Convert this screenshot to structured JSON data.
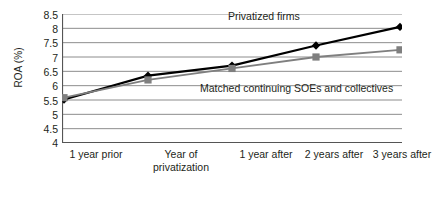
{
  "chart_data": {
    "type": "line",
    "title": "",
    "xlabel": "",
    "ylabel": "ROA (%)",
    "categories": [
      "1 year prior",
      "Year of privatization",
      "1 year after",
      "2 years after",
      "3 years after"
    ],
    "series": [
      {
        "name": "Privatized firms",
        "color": "#000000",
        "marker": "diamond",
        "values": [
          5.52,
          6.35,
          6.7,
          7.4,
          8.05
        ]
      },
      {
        "name": "Matched continuing SOEs and collectives",
        "color": "#7f7f7f",
        "marker": "square",
        "values": [
          5.58,
          6.2,
          6.6,
          7.0,
          7.25
        ]
      }
    ],
    "ylim": [
      4,
      8.5
    ],
    "yticks": [
      "4",
      "4.5",
      "5",
      "5.5",
      "6",
      "6.5",
      "7",
      "7.5",
      "8",
      "8.5"
    ],
    "ytick_values": [
      4,
      4.5,
      5,
      5.5,
      6,
      6.5,
      7,
      7.5,
      8,
      8.5
    ],
    "grid": true,
    "grid_color": "#808080",
    "legend_position": "inline-annotations",
    "annotations": [
      {
        "text": "Privatized firms",
        "series": "Privatized firms"
      },
      {
        "text": "Matched continuing SOEs and collectives",
        "series": "Matched continuing SOEs and collectives"
      }
    ]
  },
  "axis": {
    "y_title": "ROA (%)",
    "y_ticks": [
      "8.5",
      "8",
      "7.5",
      "7",
      "6.5",
      "6",
      "5.5",
      "5",
      "4.5",
      "4"
    ],
    "x_ticks": [
      {
        "line1": "1 year prior",
        "line2": ""
      },
      {
        "line1": "Year of",
        "line2": "privatization"
      },
      {
        "line1": "1 year after",
        "line2": ""
      },
      {
        "line1": "2 years after",
        "line2": ""
      },
      {
        "line1": "3 years after",
        "line2": ""
      }
    ]
  },
  "labels": {
    "privatized": "Privatized firms",
    "matched": "Matched continuing SOEs and collectives"
  }
}
